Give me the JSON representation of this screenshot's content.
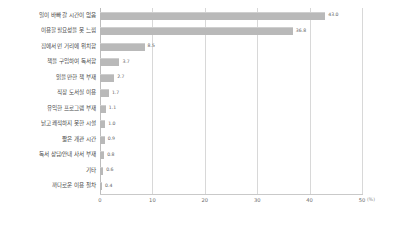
{
  "chart_data": {
    "type": "bar",
    "orientation": "horizontal",
    "title": "",
    "subtitle": "",
    "xlabel": "",
    "ylabel": "",
    "unit_label": "(%)",
    "xlim": [
      0,
      50
    ],
    "xticks": [
      "0",
      "10",
      "20",
      "30",
      "40",
      "50"
    ],
    "xtick_values": [
      0,
      10,
      20,
      30,
      40,
      50
    ],
    "grid": true,
    "legend": "none",
    "bar_color": "#b9b9b9",
    "grid_color": "#d8d8d8",
    "categories": [
      "일이 바빠 갈 시간이 없음",
      "이용할 필요성을 못 느낌",
      "집에서 먼 거리에 위치함",
      "책을 구입하여 독서함",
      "읽을 만한 책 부재",
      "직장 도서실 이용",
      "유익한 프로그램 부재",
      "낡고 쾌적하지 못한 시설",
      "짧은 개관 시간",
      "독서 상담/안내 사서 부재",
      "기타",
      "까다로운 이용 절차"
    ],
    "values": [
      43.0,
      36.8,
      8.5,
      3.7,
      2.7,
      1.7,
      1.1,
      1.0,
      0.9,
      0.8,
      0.6,
      0.4
    ],
    "value_labels": [
      "43.0",
      "36.8",
      "8.5",
      "3.7",
      "2.7",
      "1.7",
      "1.1",
      "1.0",
      "0.9",
      "0.8",
      "0.6",
      "0.4"
    ]
  }
}
